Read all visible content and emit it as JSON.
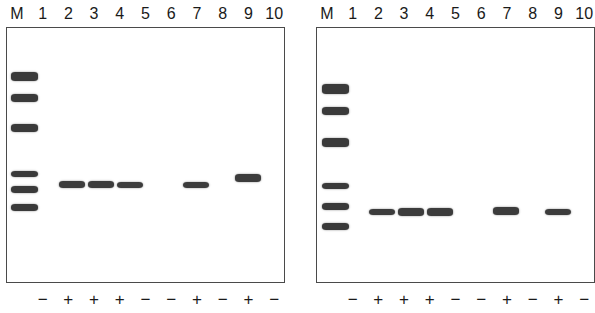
{
  "figure": {
    "type": "agarose-gel-electrophoresis",
    "panel_count": 2,
    "background_color": "#ffffff",
    "band_color": "#3c3c3c",
    "border_color": "#4a4a4a"
  },
  "lane_labels": [
    "M",
    "1",
    "2",
    "3",
    "4",
    "5",
    "6",
    "7",
    "8",
    "9",
    "10"
  ],
  "panels": [
    {
      "id": "left-gel",
      "position": "left",
      "lane_labels": [
        "M",
        "1",
        "2",
        "3",
        "4",
        "5",
        "6",
        "7",
        "8",
        "9",
        "10"
      ],
      "signs": [
        "−",
        "+",
        "+",
        "+",
        "−",
        "−",
        "+",
        "−",
        "+",
        "−"
      ],
      "sign_lane_map": [
        "1",
        "2",
        "3",
        "4",
        "5",
        "6",
        "7",
        "8",
        "9",
        "10"
      ],
      "marker_band_count": 6,
      "sample_band_lanes": [
        "2",
        "3",
        "4",
        "7",
        "9"
      ],
      "empty_lanes": [
        "1",
        "5",
        "6",
        "8",
        "10"
      ]
    },
    {
      "id": "right-gel",
      "position": "right",
      "lane_labels": [
        "M",
        "1",
        "2",
        "3",
        "4",
        "5",
        "6",
        "7",
        "8",
        "9",
        "10"
      ],
      "signs": [
        "−",
        "+",
        "+",
        "+",
        "−",
        "−",
        "+",
        "−",
        "+",
        "−"
      ],
      "sign_lane_map": [
        "1",
        "2",
        "3",
        "4",
        "5",
        "6",
        "7",
        "8",
        "9",
        "10"
      ],
      "marker_band_count": 6,
      "sample_band_lanes": [
        "2",
        "3",
        "4",
        "7",
        "9"
      ],
      "empty_lanes": [
        "1",
        "5",
        "6",
        "8",
        "10"
      ]
    }
  ],
  "chart_data": {
    "type": "table",
    "title": "",
    "xlabel": "",
    "ylabel": "",
    "series": [
      {
        "name": "left-gel-marker-ladder",
        "lane": "M",
        "panel": "left",
        "bands_y": [
          73,
          95,
          125,
          172,
          187,
          205
        ]
      },
      {
        "name": "left-gel-sample-bands",
        "panel": "left",
        "lanes": [
          "2",
          "3",
          "4",
          "7",
          "9"
        ],
        "bands_y": [
          182,
          182,
          182,
          182,
          176
        ]
      },
      {
        "name": "right-gel-marker-ladder",
        "lane": "M",
        "panel": "right",
        "bands_y": [
          91,
          112,
          143,
          188,
          208,
          228
        ]
      },
      {
        "name": "right-gel-sample-bands",
        "panel": "right",
        "lanes": [
          "2",
          "3",
          "4",
          "7",
          "9"
        ],
        "bands_y": [
          212,
          212,
          212,
          212,
          212
        ]
      }
    ]
  },
  "geometry": {
    "left_panel": {
      "marker_bands": [
        {
          "x": 4,
          "y": 44,
          "w": 27,
          "h": 9
        },
        {
          "x": 4,
          "y": 66,
          "w": 27,
          "h": 8
        },
        {
          "x": 4,
          "y": 96,
          "w": 27,
          "h": 8
        },
        {
          "x": 4,
          "y": 143,
          "w": 27,
          "h": 6
        },
        {
          "x": 4,
          "y": 158,
          "w": 27,
          "h": 7
        },
        {
          "x": 4,
          "y": 176,
          "w": 27,
          "h": 7
        }
      ],
      "sample_bands": [
        {
          "lane": "2",
          "x": 52,
          "y": 153,
          "w": 26,
          "h": 7
        },
        {
          "lane": "3",
          "x": 81,
          "y": 153,
          "w": 26,
          "h": 7
        },
        {
          "lane": "4",
          "x": 110,
          "y": 154,
          "w": 26,
          "h": 6
        },
        {
          "lane": "7",
          "x": 176,
          "y": 154,
          "w": 26,
          "h": 6
        },
        {
          "lane": "9",
          "x": 228,
          "y": 146,
          "w": 26,
          "h": 8
        }
      ]
    },
    "right_panel": {
      "marker_bands": [
        {
          "x": 5,
          "y": 56,
          "w": 27,
          "h": 10
        },
        {
          "x": 5,
          "y": 79,
          "w": 27,
          "h": 8
        },
        {
          "x": 5,
          "y": 110,
          "w": 27,
          "h": 9
        },
        {
          "x": 5,
          "y": 155,
          "w": 27,
          "h": 6
        },
        {
          "x": 5,
          "y": 175,
          "w": 27,
          "h": 7
        },
        {
          "x": 5,
          "y": 195,
          "w": 27,
          "h": 7
        }
      ],
      "sample_bands": [
        {
          "lane": "2",
          "x": 52,
          "y": 181,
          "w": 26,
          "h": 6
        },
        {
          "lane": "3",
          "x": 81,
          "y": 180,
          "w": 26,
          "h": 8
        },
        {
          "lane": "4",
          "x": 110,
          "y": 180,
          "w": 26,
          "h": 8
        },
        {
          "lane": "7",
          "x": 176,
          "y": 179,
          "w": 26,
          "h": 8
        },
        {
          "lane": "9",
          "x": 228,
          "y": 181,
          "w": 26,
          "h": 6
        }
      ]
    }
  }
}
